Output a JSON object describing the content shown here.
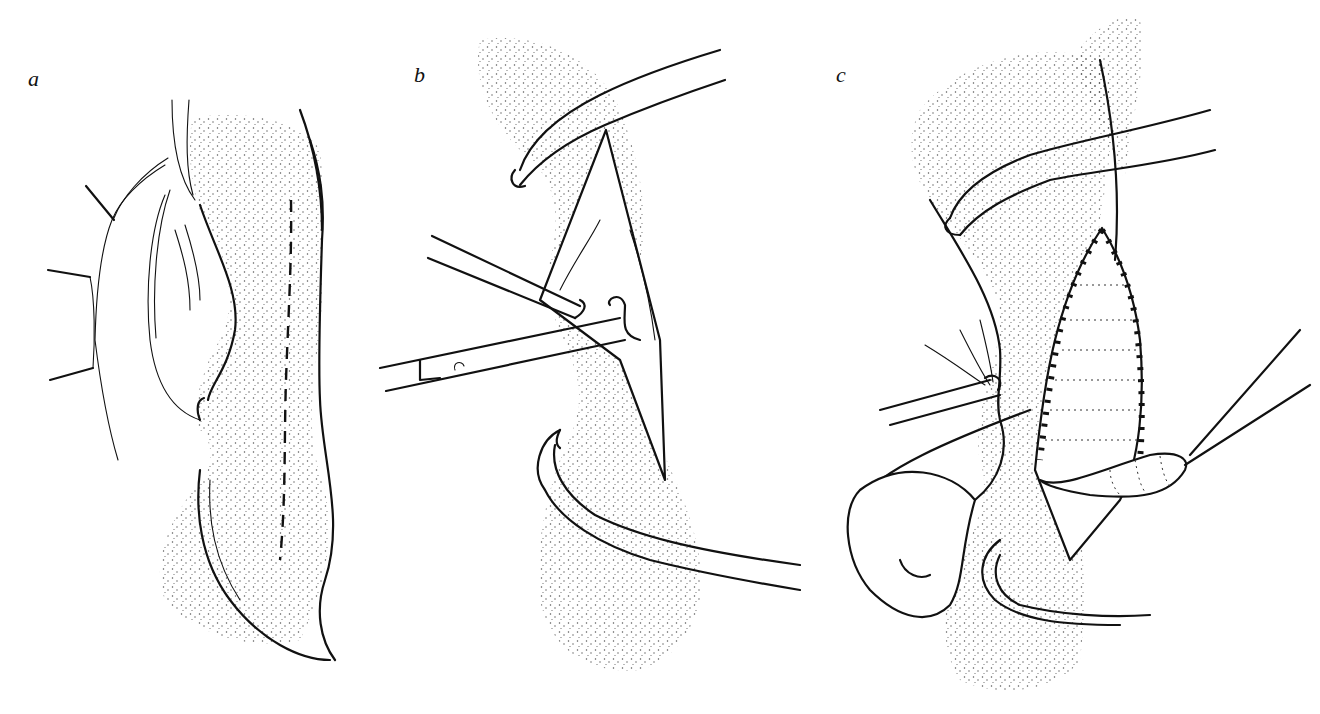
{
  "figure": {
    "panels": [
      {
        "label": "a",
        "content": "Organ with dashed incision line; adjacent membrane with tethering vessels"
      },
      {
        "label": "b",
        "content": "Opened incision held by forceps and scissors"
      },
      {
        "label": "c",
        "content": "Sutured closure with cross-stitched suture line and retracted flap"
      }
    ],
    "colors": {
      "ink": "#111111",
      "background": "#ffffff",
      "stipple": "#555555"
    }
  }
}
